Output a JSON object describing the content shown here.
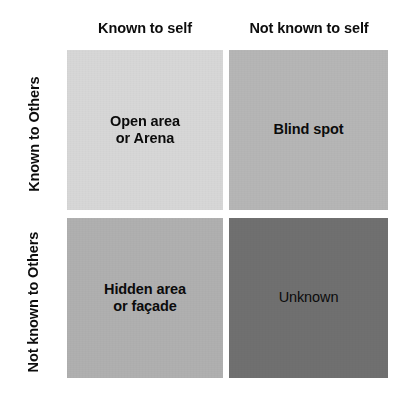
{
  "diagram": {
    "columns": [
      {
        "id": "known-self",
        "label": "Known to self"
      },
      {
        "id": "not-known-self",
        "label": "Not known to self"
      }
    ],
    "rows": [
      {
        "id": "known-others",
        "label": "Known to Others"
      },
      {
        "id": "not-known-others",
        "label": "Not known\nto Others"
      }
    ],
    "quadrants": [
      {
        "id": "open-area",
        "label": "Open area\nor Arena",
        "row": "known-others",
        "column": "known-self",
        "fill": "#d7d7d7",
        "bold": true
      },
      {
        "id": "blind-spot",
        "label": "Blind spot",
        "row": "known-others",
        "column": "not-known-self",
        "fill": "#b6b6b6",
        "bold": true
      },
      {
        "id": "hidden-area",
        "label": "Hidden area\nor façade",
        "row": "not-known-others",
        "column": "known-self",
        "fill": "#b0b0b0",
        "bold": true
      },
      {
        "id": "unknown",
        "label": "Unknown",
        "row": "not-known-others",
        "column": "not-known-self",
        "fill": "#707070",
        "bold": false
      }
    ],
    "colors": {
      "background": "#ffffff",
      "text": "#0d0d0d",
      "gutter": "#ffffff"
    }
  }
}
